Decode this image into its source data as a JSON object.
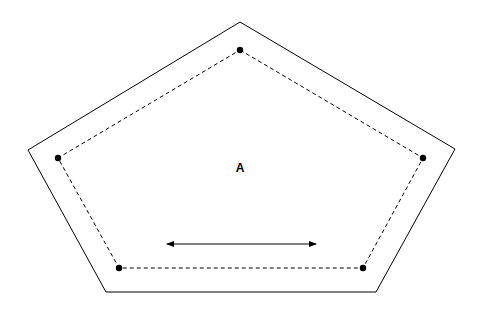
{
  "diagram": {
    "type": "nested-pentagon",
    "stroke_color": "#000000",
    "background": "#ffffff",
    "outer_pentagon": {
      "style": "solid",
      "points": [
        [
          240,
          22
        ],
        [
          455,
          149
        ],
        [
          376,
          292
        ],
        [
          106,
          292
        ],
        [
          28,
          150
        ]
      ]
    },
    "inner_pentagon": {
      "style": "dashed",
      "points": [
        [
          240,
          50
        ],
        [
          423,
          158
        ],
        [
          363,
          268
        ],
        [
          119,
          268
        ],
        [
          58,
          158
        ]
      ]
    },
    "vertex_dots": [
      [
        240,
        50
      ],
      [
        423,
        158
      ],
      [
        363,
        268
      ],
      [
        119,
        268
      ],
      [
        58,
        158
      ]
    ],
    "region_label": {
      "text": "A",
      "x": 240,
      "y": 168
    },
    "arrow": {
      "type": "double-headed",
      "x1": 167,
      "y1": 244,
      "x2": 316,
      "y2": 244
    }
  }
}
